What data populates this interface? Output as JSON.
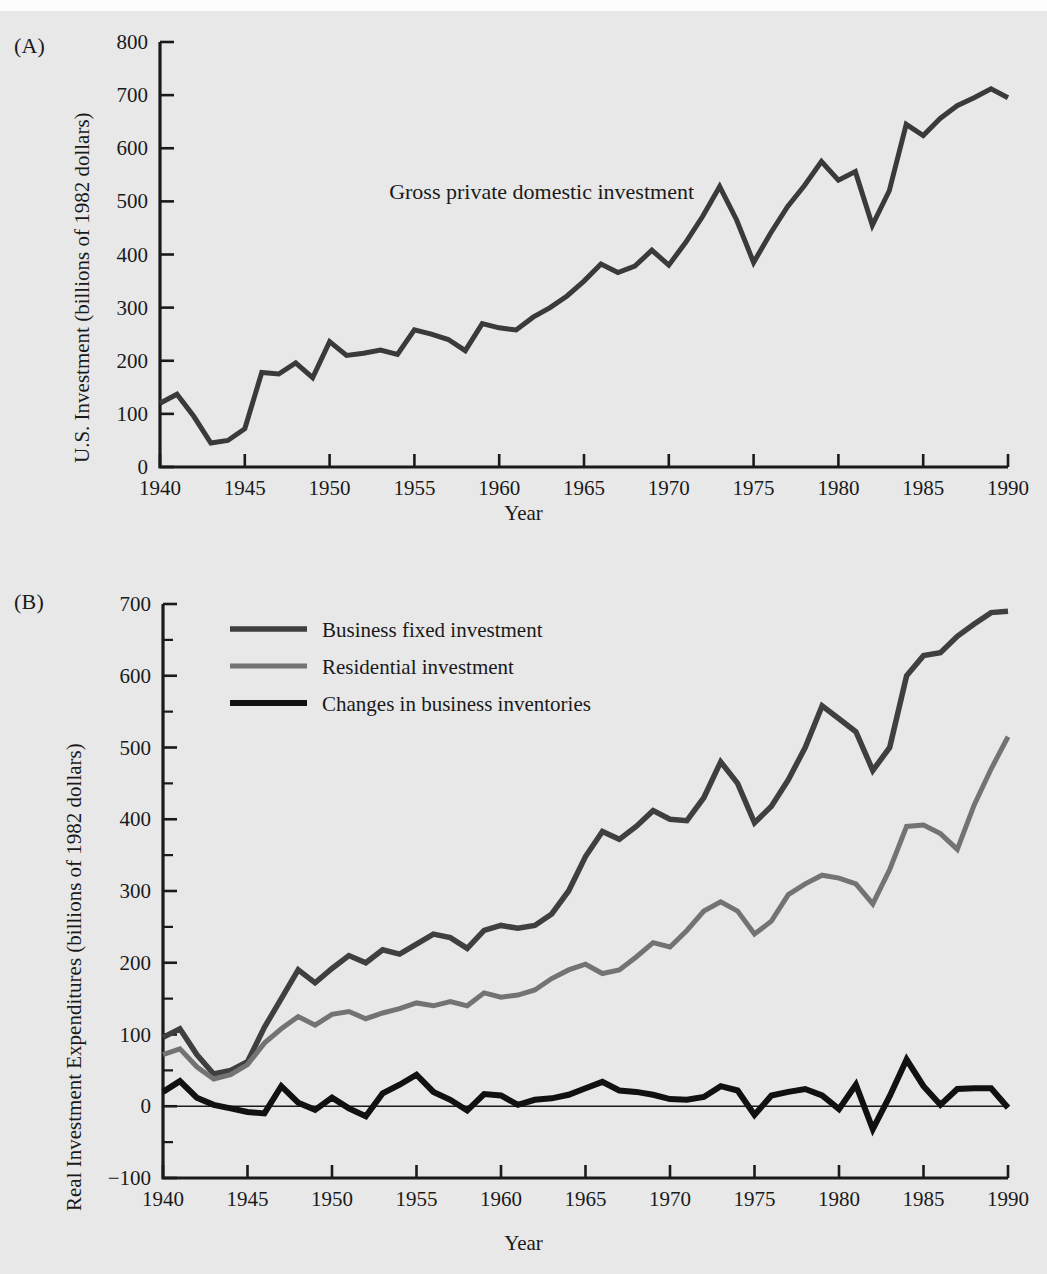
{
  "figure": {
    "background_color": "#e8e8e8",
    "panels": [
      {
        "letter": "(A)",
        "ylabel": "U.S. Investment (billions of 1982 dollars)",
        "xlabel": "Year"
      },
      {
        "letter": "(B)",
        "ylabel": "Real Investment Expenditures (billions of 1982 dollars)",
        "xlabel": "Year"
      }
    ]
  },
  "chart_data": [
    {
      "type": "line",
      "panel": "(A)",
      "title": "",
      "xlabel": "Year",
      "ylabel": "U.S. Investment (billions of 1982 dollars)",
      "xlim": [
        1940,
        1990
      ],
      "ylim": [
        0,
        800
      ],
      "xticks": [
        1940,
        1945,
        1950,
        1955,
        1960,
        1965,
        1970,
        1975,
        1980,
        1985,
        1990
      ],
      "yticks": [
        0,
        100,
        200,
        300,
        400,
        500,
        600,
        700,
        800
      ],
      "grid": false,
      "legend": "none",
      "annotations": [
        {
          "text": "Gross private domestic investment",
          "x": 1962.5,
          "y": 505
        }
      ],
      "x": [
        1940,
        1941,
        1942,
        1943,
        1944,
        1945,
        1946,
        1947,
        1948,
        1949,
        1950,
        1951,
        1952,
        1953,
        1954,
        1955,
        1956,
        1957,
        1958,
        1959,
        1960,
        1961,
        1962,
        1963,
        1964,
        1965,
        1966,
        1967,
        1968,
        1969,
        1970,
        1971,
        1972,
        1973,
        1974,
        1975,
        1976,
        1977,
        1978,
        1979,
        1980,
        1981,
        1982,
        1983,
        1984,
        1985,
        1986,
        1987,
        1988,
        1989,
        1990
      ],
      "series": [
        {
          "name": "Gross private domestic investment",
          "color": "#3a3a3a",
          "linewidth": 5,
          "values": [
            120,
            137,
            95,
            45,
            50,
            72,
            178,
            175,
            196,
            168,
            236,
            210,
            214,
            220,
            212,
            258,
            250,
            240,
            219,
            270,
            262,
            258,
            282,
            300,
            322,
            350,
            382,
            366,
            378,
            408,
            380,
            423,
            472,
            528,
            465,
            385,
            440,
            490,
            530,
            575,
            540,
            556,
            455,
            520,
            645,
            624,
            656,
            680,
            695,
            712,
            695
          ]
        }
      ]
    },
    {
      "type": "line",
      "panel": "(B)",
      "title": "",
      "xlabel": "Year",
      "ylabel": "Real Investment Expenditures (billions of 1982 dollars)",
      "xlim": [
        1940,
        1990
      ],
      "ylim": [
        -100,
        700
      ],
      "xticks": [
        1940,
        1945,
        1950,
        1955,
        1960,
        1965,
        1970,
        1975,
        1980,
        1985,
        1990
      ],
      "yticks": [
        -100,
        0,
        100,
        200,
        300,
        400,
        500,
        600,
        700
      ],
      "grid": false,
      "legend": "upper left",
      "x": [
        1940,
        1941,
        1942,
        1943,
        1944,
        1945,
        1946,
        1947,
        1948,
        1949,
        1950,
        1951,
        1952,
        1953,
        1954,
        1955,
        1956,
        1957,
        1958,
        1959,
        1960,
        1961,
        1962,
        1963,
        1964,
        1965,
        1966,
        1967,
        1968,
        1969,
        1970,
        1971,
        1972,
        1973,
        1974,
        1975,
        1976,
        1977,
        1978,
        1979,
        1980,
        1981,
        1982,
        1983,
        1984,
        1985,
        1986,
        1987,
        1988,
        1989,
        1990
      ],
      "series": [
        {
          "name": "Business fixed investment",
          "color": "#3f3f3f",
          "linewidth": 5.5,
          "values": [
            96,
            108,
            72,
            45,
            50,
            62,
            110,
            150,
            190,
            172,
            192,
            210,
            200,
            218,
            212,
            226,
            240,
            235,
            220,
            245,
            252,
            248,
            252,
            268,
            300,
            348,
            383,
            372,
            390,
            412,
            400,
            398,
            430,
            480,
            450,
            395,
            418,
            455,
            500,
            558,
            540,
            522,
            468,
            500,
            600,
            628,
            632,
            655,
            672,
            688,
            690
          ]
        },
        {
          "name": "Residential investment",
          "color": "#737373",
          "linewidth": 5,
          "values": [
            72,
            80,
            55,
            38,
            44,
            58,
            88,
            108,
            125,
            113,
            128,
            132,
            122,
            130,
            136,
            144,
            140,
            146,
            140,
            158,
            152,
            155,
            162,
            178,
            190,
            198,
            185,
            190,
            208,
            228,
            222,
            245,
            272,
            285,
            272,
            240,
            258,
            295,
            310,
            322,
            318,
            310,
            282,
            330,
            390,
            392,
            380,
            358,
            420,
            470,
            515
          ]
        },
        {
          "name": "Changes in business inventories",
          "color": "#111111",
          "linewidth": 6,
          "values": [
            20,
            35,
            12,
            2,
            -3,
            -8,
            -10,
            28,
            5,
            -5,
            12,
            -3,
            -14,
            18,
            30,
            44,
            20,
            9,
            -6,
            17,
            15,
            2,
            9,
            11,
            16,
            25,
            34,
            22,
            20,
            16,
            10,
            9,
            13,
            28,
            22,
            -12,
            15,
            20,
            24,
            15,
            -4,
            30,
            -32,
            14,
            65,
            28,
            2,
            24,
            25,
            25,
            -2
          ]
        }
      ]
    }
  ]
}
